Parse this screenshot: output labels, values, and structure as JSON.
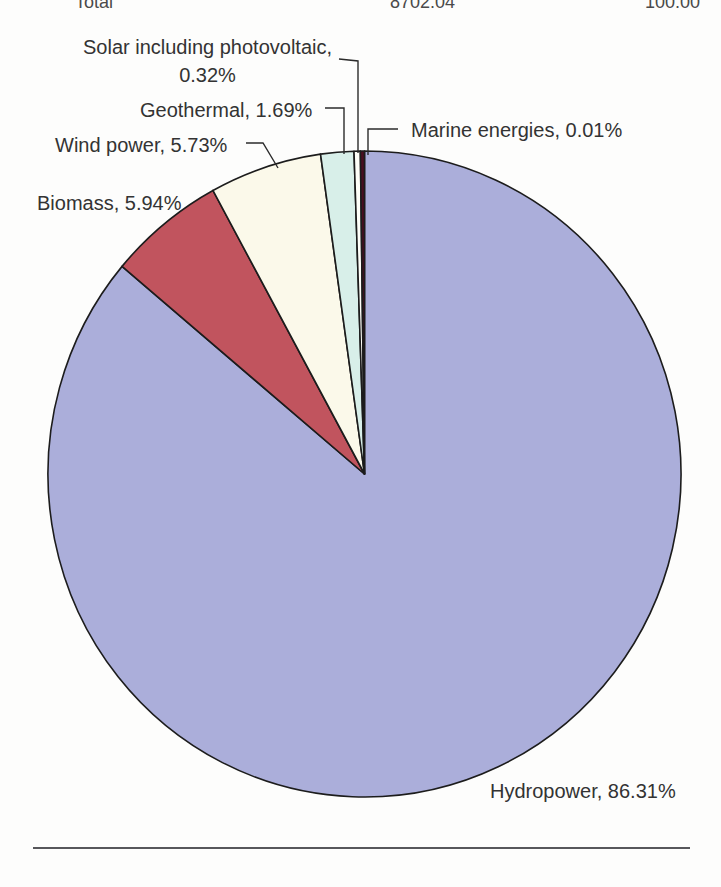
{
  "total_row": {
    "label": "Total",
    "amount": "8702.04",
    "percent": "100.00"
  },
  "chart_data": {
    "type": "pie",
    "title": "",
    "legend": "none",
    "direction": "clockwise",
    "start_angle_deg": 0,
    "slices": [
      {
        "label": "Hydropower",
        "value": 86.31,
        "color": "#abaeda"
      },
      {
        "label": "Biomass",
        "value": 5.94,
        "color": "#c1545e"
      },
      {
        "label": "Wind power",
        "value": 5.73,
        "color": "#fbf9ea"
      },
      {
        "label": "Geothermal",
        "value": 1.69,
        "color": "#d8efe9"
      },
      {
        "label": "Solar including photovoltaic",
        "value": 0.32,
        "color": "#fefef8"
      },
      {
        "label": "Marine energies",
        "value": 0.01,
        "color": "#4a0e20"
      }
    ],
    "outline_color": "#1c1c1c",
    "leader_line_color": "#2b2b2b",
    "label_format": "{label}, {value}%"
  },
  "labels": {
    "solar_line1": "Solar including photovoltaic,",
    "solar_line2": "0.32%",
    "geothermal": "Geothermal, 1.69%",
    "wind": "Wind power, 5.73%",
    "biomass": "Biomass, 5.94%",
    "marine": "Marine energies, 0.01%",
    "hydropower": "Hydropower, 86.31%"
  }
}
